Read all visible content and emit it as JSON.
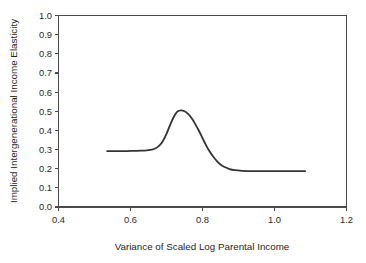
{
  "figure": {
    "background_color": "#ffffff",
    "axis_color": "#4a4a4a",
    "text_color": "#2b2b2b"
  },
  "chart_data": {
    "type": "line",
    "title": "",
    "subtitle": "",
    "xlabel": "Variance of Scaled Log Parental Income",
    "ylabel": "Implied Intergenerational Income Elasticity",
    "xlim": [
      0.4,
      1.2
    ],
    "ylim": [
      0.0,
      1.0
    ],
    "xticks": [
      0.4,
      0.6,
      0.8,
      1.0,
      1.2
    ],
    "xticklabels": [
      "0.4",
      "0.6",
      "0.8",
      "1.0",
      "1.2"
    ],
    "yticks": [
      0.0,
      0.1,
      0.2,
      0.3,
      0.4,
      0.5,
      0.6,
      0.7,
      0.8,
      0.9,
      1.0
    ],
    "yticklabels": [
      "0.0",
      "0.1",
      "0.2",
      "0.3",
      "0.4",
      "0.5",
      "0.6",
      "0.7",
      "0.8",
      "0.9",
      "1.0"
    ],
    "grid": false,
    "legend": null,
    "legend_position": "none",
    "annotations": [],
    "series": [
      {
        "name": "Implied IGE",
        "color": "#333333",
        "line_width": 1.8,
        "x": [
          0.535,
          0.55,
          0.57,
          0.59,
          0.61,
          0.63,
          0.645,
          0.66,
          0.67,
          0.68,
          0.69,
          0.7,
          0.71,
          0.72,
          0.73,
          0.74,
          0.75,
          0.76,
          0.77,
          0.78,
          0.79,
          0.8,
          0.81,
          0.82,
          0.83,
          0.84,
          0.85,
          0.86,
          0.875,
          0.89,
          0.91,
          0.94,
          0.98,
          1.02,
          1.06,
          1.085
        ],
        "y": [
          0.292,
          0.292,
          0.292,
          0.292,
          0.293,
          0.294,
          0.296,
          0.3,
          0.307,
          0.32,
          0.345,
          0.382,
          0.428,
          0.47,
          0.498,
          0.505,
          0.5,
          0.486,
          0.463,
          0.433,
          0.398,
          0.36,
          0.322,
          0.29,
          0.262,
          0.24,
          0.222,
          0.21,
          0.198,
          0.192,
          0.189,
          0.187,
          0.187,
          0.187,
          0.187,
          0.187
        ]
      }
    ],
    "peak": {
      "x": 0.735,
      "y": 0.505
    },
    "left_plateau_value": 0.292,
    "right_plateau_value": 0.187
  }
}
